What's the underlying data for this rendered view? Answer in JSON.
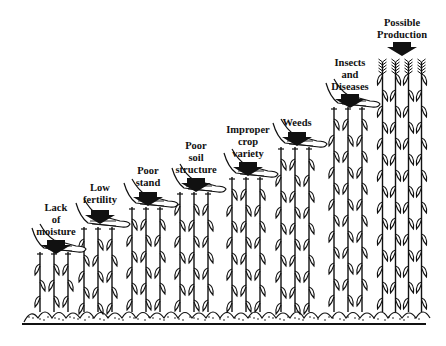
{
  "colors": {
    "ink": "#111111",
    "background": "#ffffff"
  },
  "stages": [
    {
      "id": "lack-of-moisture",
      "lines": [
        "Lack",
        "of",
        "moisture"
      ],
      "label_x": 56,
      "label_y": 202,
      "arrow_x": 56,
      "arrow_y": 240,
      "plant_height": 60
    },
    {
      "id": "low-fertility",
      "lines": [
        "Low",
        "fertility"
      ],
      "label_x": 100,
      "label_y": 182,
      "arrow_x": 100,
      "arrow_y": 210,
      "plant_height": 85
    },
    {
      "id": "poor-stand",
      "lines": [
        "Poor",
        "stand"
      ],
      "label_x": 148,
      "label_y": 168,
      "arrow_x": 148,
      "arrow_y": 192,
      "plant_height": 105
    },
    {
      "id": "poor-soil-structure",
      "lines": [
        "Poor",
        "soil",
        "structure"
      ],
      "label_x": 196,
      "label_y": 140,
      "arrow_x": 196,
      "arrow_y": 178,
      "plant_height": 120
    },
    {
      "id": "improper-crop-variety",
      "lines": [
        "Improper",
        "crop",
        "variety"
      ],
      "label_x": 248,
      "label_y": 124,
      "arrow_x": 248,
      "arrow_y": 162,
      "plant_height": 135
    },
    {
      "id": "weeds",
      "lines": [
        "Weeds"
      ],
      "label_x": 297,
      "label_y": 118,
      "arrow_x": 297,
      "arrow_y": 132,
      "plant_height": 165
    },
    {
      "id": "insects-and-diseases",
      "lines": [
        "Insects",
        "and",
        "Diseases"
      ],
      "label_x": 350,
      "label_y": 56,
      "arrow_x": 350,
      "arrow_y": 94,
      "plant_height": 205
    },
    {
      "id": "possible-production",
      "lines": [
        "Possible",
        "Production"
      ],
      "label_x": 402,
      "label_y": 18,
      "arrow_x": 402,
      "arrow_y": 42,
      "plant_height": 250
    }
  ]
}
